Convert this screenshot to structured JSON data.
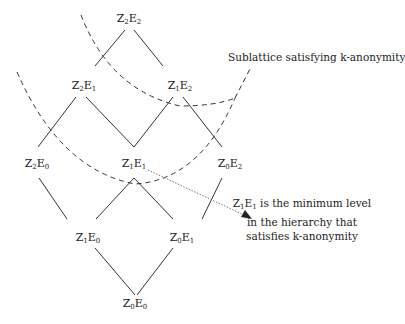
{
  "diagram": {
    "nodes": [
      {
        "id": "Z2E2",
        "z": "2",
        "e": "2",
        "x": 129,
        "y": 16
      },
      {
        "id": "Z2E1",
        "z": "2",
        "e": "1",
        "x": 84,
        "y": 80
      },
      {
        "id": "Z1E2",
        "z": "1",
        "e": "2",
        "x": 180,
        "y": 80
      },
      {
        "id": "Z2E0",
        "z": "2",
        "e": "0",
        "x": 37,
        "y": 158
      },
      {
        "id": "Z1E1",
        "z": "1",
        "e": "1",
        "x": 134,
        "y": 158
      },
      {
        "id": "Z0E2",
        "z": "0",
        "e": "2",
        "x": 230,
        "y": 158
      },
      {
        "id": "Z1E0",
        "z": "1",
        "e": "0",
        "x": 88,
        "y": 232
      },
      {
        "id": "Z0E1",
        "z": "0",
        "e": "1",
        "x": 182,
        "y": 232
      },
      {
        "id": "Z0E0",
        "z": "0",
        "e": "0",
        "x": 135,
        "y": 298
      }
    ],
    "node_prefix": {
      "z": "Z",
      "e": "E"
    },
    "sublattice_label": "Sublattice satisfying k-anonymity",
    "annotation": {
      "node_z": "1",
      "node_e": "1",
      "line1_rest": " is the minimum level",
      "line2": "in the hierarchy that",
      "line3": "satisfies k-anonymity"
    },
    "colors": {
      "line": "#333333",
      "dotted": "#777777",
      "text": "#222222"
    }
  }
}
